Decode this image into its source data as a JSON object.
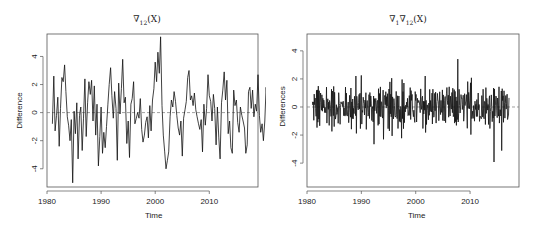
{
  "chart_data": [
    {
      "type": "line",
      "title": "∇12(X)",
      "title_parts": {
        "symbol": "∇",
        "sub": "12",
        "suffix": "(X)"
      },
      "xlabel": "Time",
      "ylabel": "Difference",
      "x_ticks": [
        1980,
        1990,
        2000,
        2010
      ],
      "y_ticks": [
        -4,
        -2,
        0,
        2,
        4
      ],
      "xlim": [
        1980,
        2019
      ],
      "ylim": [
        -5.3,
        5.6
      ],
      "reference_line": {
        "y": 0,
        "style": "dashed"
      },
      "grid": false,
      "x_start": 1981.0,
      "x_step": 0.25,
      "values": [
        -0.8,
        2.6,
        -1.3,
        -0.2,
        1.1,
        -2.4,
        0.3,
        2.5,
        2.2,
        3.4,
        1.5,
        -0.3,
        -0.9,
        -2.0,
        -0.5,
        -5.0,
        0.1,
        -1.5,
        0.7,
        -3.3,
        -0.2,
        0.4,
        -2.7,
        -0.4,
        2.4,
        -1.7,
        0.7,
        2.2,
        1.3,
        2.3,
        -0.6,
        1.9,
        -1.6,
        0.6,
        -3.8,
        -1.7,
        0.4,
        -2.9,
        -1.4,
        -2.5,
        -1.0,
        0.6,
        2.0,
        3.2,
        1.2,
        -0.4,
        1.5,
        0.3,
        -3.4,
        2.1,
        -0.1,
        1.7,
        3.8,
        0.7,
        1.1,
        -2.2,
        -0.6,
        -3.2,
        0.6,
        1.0,
        2.2,
        -0.8,
        -0.4,
        0.0,
        -0.4,
        1.0,
        -1.2,
        -2.1,
        -1.6,
        -0.7,
        -0.3,
        -1.8,
        0.5,
        -1.3,
        0.9,
        1.7,
        3.6,
        2.2,
        4.3,
        2.8,
        5.4,
        0.5,
        -1.6,
        -2.8,
        -4.0,
        -3.4,
        -2.8,
        -0.3,
        0.9,
        0.4,
        1.5,
        0.8,
        -0.2,
        -1.1,
        -1.6,
        -0.6,
        -3.1,
        -0.4,
        0.2,
        0.8,
        2.5,
        3.0,
        0.9,
        1.2,
        0.5,
        1.4,
        0.2,
        -0.3,
        -0.8,
        -1.2,
        -0.5,
        -2.8,
        0.6,
        -0.9,
        0.3,
        2.7,
        1.2,
        0.8,
        -0.6,
        1.3,
        0.3,
        -2.3,
        0.4,
        -1.8,
        -3.3,
        0.7,
        1.6,
        2.9,
        0.9,
        2.3,
        -1.5,
        -0.6,
        -2.5,
        -2.9,
        1.6,
        0.5,
        0.9,
        -0.7,
        -1.4,
        0.4,
        -0.2,
        -0.6,
        -1.1,
        -2.9,
        -2.3,
        1.5,
        1.8,
        0.3,
        1.6,
        -0.3,
        0.6,
        0.1,
        2.7,
        -0.2,
        -1.4,
        -0.8,
        -2.0,
        -0.6,
        1.8,
        0.5,
        0.9,
        1.3,
        2.2,
        1.0,
        0.1,
        -0.2,
        1.3,
        0.4,
        2.1,
        0.9,
        3.6,
        0.2,
        -0.3,
        -2.1,
        -1.3,
        -2.4,
        -0.4,
        -3.5,
        -4.1,
        -1.8
      ]
    },
    {
      "type": "line",
      "title": "∇1∇12(X)",
      "title_parts": {
        "symbol": "∇",
        "sub1": "1",
        "sub2": "12",
        "suffix": "(X)"
      },
      "xlabel": "Time",
      "ylabel": "Differences",
      "x_ticks": [
        1980,
        1990,
        2000,
        2010
      ],
      "y_ticks": [
        -4,
        -2,
        0,
        2,
        4
      ],
      "xlim": [
        1980,
        2019
      ],
      "ylim": [
        -5.7,
        5.2
      ],
      "reference_line": {
        "y": 0,
        "style": "dashed"
      },
      "grid": false,
      "x_start": 1981.0,
      "x_step": 0.0833,
      "values": []
    }
  ]
}
